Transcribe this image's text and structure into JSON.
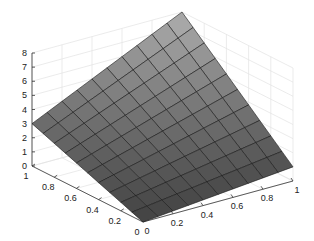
{
  "chart_data": {
    "type": "surface",
    "title": "",
    "xlabel": "",
    "ylabel": "",
    "zlabel": "",
    "grid": true,
    "mesh_resolution": 10,
    "x": [
      0,
      0.1,
      0.2,
      0.3,
      0.4,
      0.5,
      0.6,
      0.7,
      0.8,
      0.9,
      1
    ],
    "y": [
      0,
      0.1,
      0.2,
      0.3,
      0.4,
      0.5,
      0.6,
      0.7,
      0.8,
      0.9,
      1
    ],
    "corner_values": {
      "z_at_x0_y0": 0,
      "z_at_x1_y0": 1,
      "z_at_x0_y1": 3,
      "z_at_x1_y1": 8
    },
    "surface_formula": "z = x + 3y + 4xy",
    "xlim": [
      0,
      1
    ],
    "ylim": [
      0,
      1
    ],
    "zlim": [
      0,
      8
    ],
    "x_ticks": [
      "0",
      "0.2",
      "0.4",
      "0.6",
      "0.8",
      "1"
    ],
    "y_ticks": [
      "0",
      "0.2",
      "0.4",
      "0.6",
      "0.8",
      "1"
    ],
    "z_ticks": [
      "0",
      "1",
      "2",
      "3",
      "4",
      "5",
      "6",
      "7",
      "8"
    ],
    "colors": {
      "surface_low": "#383838",
      "surface_high": "#b8b8b8",
      "edge": "#1a1a1a",
      "grid": "#e2e2e2",
      "axis": "#333333"
    }
  }
}
